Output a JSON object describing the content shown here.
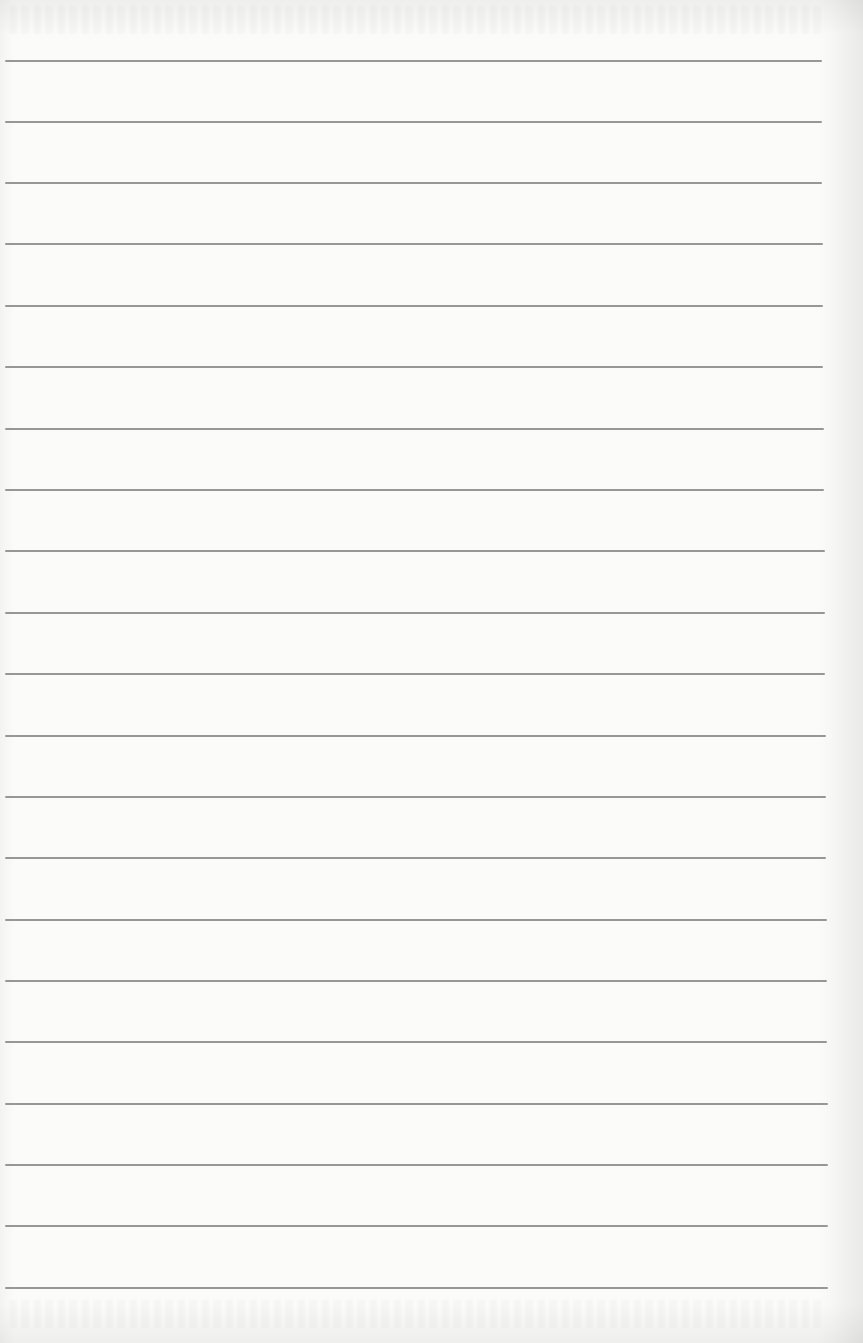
{
  "page": {
    "type": "blank-lined-paper",
    "background_color": "#fbfbf9",
    "line_color": "#8c8c8c",
    "line_count": 21,
    "lines": [
      {
        "y": 61,
        "x_start": 5,
        "x_end": 822
      },
      {
        "y": 122,
        "x_start": 5,
        "x_end": 822
      },
      {
        "y": 183,
        "x_start": 5,
        "x_end": 822
      },
      {
        "y": 244,
        "x_start": 5,
        "x_end": 823
      },
      {
        "y": 306,
        "x_start": 5,
        "x_end": 823
      },
      {
        "y": 367,
        "x_start": 5,
        "x_end": 823
      },
      {
        "y": 429,
        "x_start": 5,
        "x_end": 824
      },
      {
        "y": 490,
        "x_start": 5,
        "x_end": 824
      },
      {
        "y": 551,
        "x_start": 5,
        "x_end": 825
      },
      {
        "y": 613,
        "x_start": 5,
        "x_end": 825
      },
      {
        "y": 674,
        "x_start": 5,
        "x_end": 825
      },
      {
        "y": 736,
        "x_start": 5,
        "x_end": 826
      },
      {
        "y": 797,
        "x_start": 5,
        "x_end": 826
      },
      {
        "y": 858,
        "x_start": 5,
        "x_end": 826
      },
      {
        "y": 920,
        "x_start": 5,
        "x_end": 827
      },
      {
        "y": 981,
        "x_start": 5,
        "x_end": 827
      },
      {
        "y": 1042,
        "x_start": 5,
        "x_end": 827
      },
      {
        "y": 1104,
        "x_start": 5,
        "x_end": 828
      },
      {
        "y": 1165,
        "x_start": 5,
        "x_end": 828
      },
      {
        "y": 1226,
        "x_start": 5,
        "x_end": 828
      },
      {
        "y": 1288,
        "x_start": 5,
        "x_end": 828
      }
    ]
  }
}
